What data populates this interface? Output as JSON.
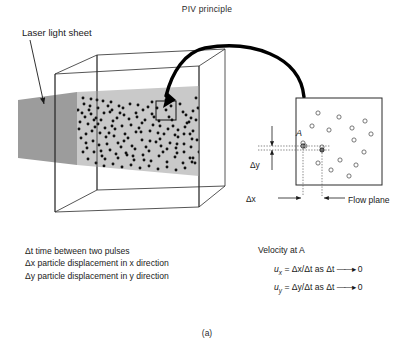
{
  "figure": {
    "title": "PIV principle",
    "caption": "(a)"
  },
  "annotations": {
    "laser_sheet_label": "Laser light sheet",
    "flow_plane_label": "Flow plane",
    "point_label": "A",
    "delta_x_label": "Δx",
    "delta_y_label": "Δy"
  },
  "legend": {
    "items": [
      "Δt time between two pulses",
      "Δx particle displacement in x direction",
      "Δy particle displacement in y direction"
    ]
  },
  "velocity": {
    "heading": "Velocity at A",
    "equations": [
      {
        "symbol": "u",
        "subscript": "x",
        "expression": "= Δx/Δt as Δt",
        "limit": "0"
      },
      {
        "symbol": "u",
        "subscript": "y",
        "expression": "= Δy/Δt as Δt",
        "limit": "0"
      }
    ]
  },
  "colors": {
    "sheet_outer": "#9c9c9c",
    "sheet_inner": "#c9c9c9",
    "particle": "#111111",
    "line": "#2b2b2b",
    "background": "#ffffff"
  },
  "chart_data": {
    "type": "diagram",
    "seeded_particles_3d": [
      [
        84,
        104
      ],
      [
        91,
        99
      ],
      [
        98,
        108
      ],
      [
        103,
        101
      ],
      [
        110,
        112
      ],
      [
        96,
        118
      ],
      [
        88,
        124
      ],
      [
        105,
        128
      ],
      [
        113,
        121
      ],
      [
        119,
        106
      ],
      [
        124,
        115
      ],
      [
        130,
        104
      ],
      [
        136,
        113
      ],
      [
        142,
        123
      ],
      [
        148,
        107
      ],
      [
        154,
        117
      ],
      [
        160,
        126
      ],
      [
        166,
        110
      ],
      [
        172,
        120
      ],
      [
        178,
        130
      ],
      [
        183,
        112
      ],
      [
        189,
        122
      ],
      [
        86,
        134
      ],
      [
        93,
        141
      ],
      [
        100,
        133
      ],
      [
        107,
        144
      ],
      [
        114,
        136
      ],
      [
        121,
        147
      ],
      [
        128,
        138
      ],
      [
        135,
        149
      ],
      [
        142,
        140
      ],
      [
        149,
        151
      ],
      [
        156,
        142
      ],
      [
        163,
        152
      ],
      [
        170,
        143
      ],
      [
        177,
        153
      ],
      [
        184,
        144
      ],
      [
        190,
        134
      ],
      [
        82,
        113
      ],
      [
        89,
        110
      ],
      [
        95,
        127
      ],
      [
        101,
        120
      ],
      [
        108,
        106
      ],
      [
        115,
        129
      ],
      [
        122,
        126
      ],
      [
        129,
        119
      ],
      [
        136,
        132
      ],
      [
        143,
        110
      ],
      [
        150,
        131
      ],
      [
        157,
        108
      ],
      [
        164,
        134
      ],
      [
        171,
        106
      ],
      [
        178,
        137
      ],
      [
        185,
        127
      ],
      [
        191,
        147
      ],
      [
        87,
        148
      ],
      [
        94,
        152
      ],
      [
        102,
        156
      ],
      [
        110,
        150
      ],
      [
        118,
        158
      ],
      [
        126,
        153
      ],
      [
        134,
        160
      ],
      [
        143,
        155
      ],
      [
        151,
        161
      ],
      [
        159,
        156
      ],
      [
        167,
        162
      ],
      [
        175,
        157
      ],
      [
        183,
        163
      ],
      [
        190,
        158
      ],
      [
        80,
        122
      ],
      [
        85,
        117
      ],
      [
        92,
        131
      ],
      [
        99,
        145
      ],
      [
        106,
        137
      ],
      [
        112,
        126
      ],
      [
        118,
        143
      ],
      [
        125,
        134
      ],
      [
        132,
        146
      ],
      [
        139,
        128
      ],
      [
        146,
        147
      ],
      [
        153,
        125
      ],
      [
        161,
        146
      ],
      [
        168,
        129
      ],
      [
        176,
        148
      ],
      [
        184,
        134
      ],
      [
        191,
        118
      ],
      [
        83,
        98
      ],
      [
        90,
        106
      ],
      [
        97,
        100
      ],
      [
        104,
        113
      ],
      [
        111,
        102
      ],
      [
        117,
        118
      ],
      [
        123,
        108
      ],
      [
        131,
        125
      ],
      [
        138,
        105
      ],
      [
        145,
        120
      ],
      [
        152,
        102
      ],
      [
        159,
        121
      ],
      [
        166,
        100
      ],
      [
        173,
        126
      ],
      [
        180,
        104
      ],
      [
        187,
        123
      ],
      [
        193,
        111
      ],
      [
        81,
        138
      ],
      [
        88,
        159
      ],
      [
        96,
        163
      ],
      [
        104,
        166
      ],
      [
        113,
        164
      ],
      [
        122,
        167
      ],
      [
        131,
        165
      ],
      [
        140,
        168
      ],
      [
        149,
        166
      ],
      [
        158,
        169
      ],
      [
        167,
        167
      ],
      [
        176,
        170
      ],
      [
        185,
        168
      ],
      [
        192,
        162
      ],
      [
        79,
        129
      ],
      [
        86,
        143
      ],
      [
        94,
        120
      ],
      [
        101,
        151
      ],
      [
        109,
        133
      ],
      [
        116,
        154
      ],
      [
        124,
        141
      ],
      [
        133,
        156
      ],
      [
        141,
        132
      ],
      [
        150,
        141
      ],
      [
        158,
        133
      ],
      [
        167,
        149
      ],
      [
        175,
        135
      ],
      [
        184,
        152
      ],
      [
        192,
        139
      ],
      [
        78,
        110
      ],
      [
        83,
        152
      ],
      [
        91,
        114
      ],
      [
        98,
        124
      ],
      [
        105,
        159
      ],
      [
        112,
        110
      ],
      [
        120,
        113
      ],
      [
        127,
        155
      ],
      [
        137,
        117
      ],
      [
        144,
        160
      ],
      [
        152,
        114
      ],
      [
        160,
        139
      ],
      [
        169,
        117
      ],
      [
        177,
        144
      ],
      [
        186,
        115
      ],
      [
        193,
        131
      ],
      [
        196,
        120
      ],
      [
        197,
        140
      ],
      [
        198,
        108
      ],
      [
        199,
        152
      ],
      [
        195,
        163
      ],
      [
        196,
        98
      ],
      [
        193,
        158
      ]
    ],
    "flow_plane_particles": [
      [
        318,
        113
      ],
      [
        339,
        117
      ],
      [
        312,
        126
      ],
      [
        329,
        130
      ],
      [
        352,
        128
      ],
      [
        365,
        121
      ],
      [
        371,
        134
      ],
      [
        305,
        146
      ],
      [
        322,
        147
      ],
      [
        354,
        140
      ],
      [
        364,
        152
      ],
      [
        340,
        160
      ],
      [
        318,
        163
      ],
      [
        331,
        170
      ],
      [
        356,
        165
      ],
      [
        349,
        176
      ],
      [
        303,
        143
      ]
    ],
    "point_A": [
      303,
      146
    ],
    "point_A2": [
      322,
      150
    ],
    "interrogation_box_3d": {
      "x": 156,
      "y": 101,
      "w": 20,
      "h": 19
    }
  }
}
